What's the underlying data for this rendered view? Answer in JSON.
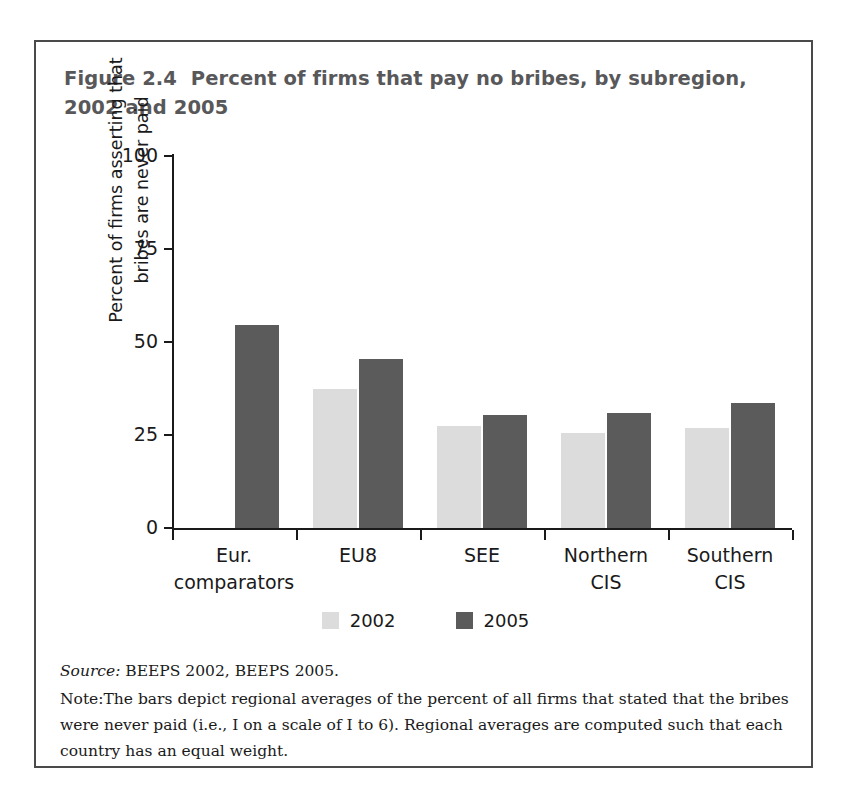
{
  "figure": {
    "title_line1": "Figure 2.4  Percent of firms that pay no bribes, by subregion,",
    "title_line2": "2002 and 2005",
    "source_label": "Source:",
    "source_text": " BEEPS 2002, BEEPS 2005.",
    "note_label": "Note:",
    "note_text": "The bars depict regional averages of the percent of all firms that stated that the bribes were never paid (i.e., I on a scale of I to 6). Regional averages are computed such that each country has an equal weight."
  },
  "colors": {
    "series_2002": "#dcdcdc",
    "series_2005": "#5b5b5b",
    "axis": "#1a1a1a",
    "title": "#58585a",
    "frame": "#4a4a4a"
  },
  "chart_data": {
    "type": "bar",
    "title": "Figure 2.4  Percent of firms that pay no bribes, by subregion, 2002 and 2005",
    "xlabel": "",
    "ylabel": "Percent of firms asserting that bribes are never paid",
    "ylabel_line1": "Percent of firms asserting that",
    "ylabel_line2": "bribes are never paid",
    "ylim": [
      0,
      100
    ],
    "yticks": [
      0,
      25,
      50,
      75,
      100
    ],
    "ytick_labels": [
      "0",
      "25",
      "50",
      "75",
      "100"
    ],
    "grid": false,
    "legend_position": "bottom-center",
    "categories": [
      "Eur. comparators",
      "EU8",
      "SEE",
      "Northern CIS",
      "Southern CIS"
    ],
    "category_lines": [
      [
        "Eur.",
        "comparators"
      ],
      [
        "EU8",
        ""
      ],
      [
        "SEE",
        ""
      ],
      [
        "Northern",
        "CIS"
      ],
      [
        "Southern",
        "CIS"
      ]
    ],
    "series": [
      {
        "name": "2002",
        "color": "#dcdcdc",
        "values": [
          null,
          37.5,
          27.5,
          25.5,
          27
        ]
      },
      {
        "name": "2005",
        "color": "#5b5b5b",
        "values": [
          54.5,
          45.5,
          30.5,
          31,
          33.5
        ]
      }
    ]
  }
}
